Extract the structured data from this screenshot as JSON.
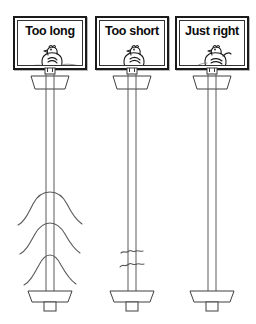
{
  "figure": {
    "title": "Too long / Too short / Just right comparison",
    "background_color": "#ffffff",
    "ink_color": "#1b1b1b",
    "line_color": "#555555"
  },
  "panels": [
    {
      "id": "too-long",
      "label": "Too long",
      "bird_icon": "chicken-icon",
      "bird_note": "chicken standing, tail feathers trailing long to both sides",
      "post_icon": "post-icon",
      "collar_icon": "collar-icon",
      "base_icon": "base-plate-icon",
      "excess_icon": "drooping-wire-icon",
      "excess_count": 3,
      "excess_note": "three long drooping arched wires hanging from the post"
    },
    {
      "id": "too-short",
      "label": "Too short",
      "bird_icon": "chicken-icon",
      "bird_note": "chicken standing with very short stubby tail",
      "post_icon": "post-icon",
      "collar_icon": "collar-icon",
      "base_icon": "base-plate-icon",
      "excess_icon": "crimped-wire-icon",
      "excess_count": 2,
      "excess_note": "two small crimped squiggle marks crossing the post"
    },
    {
      "id": "just-right",
      "label": "Just right",
      "bird_icon": "chicken-icon",
      "bird_note": "chicken standing with a single neat curled tail",
      "post_icon": "post-icon",
      "collar_icon": "collar-icon",
      "base_icon": "base-plate-icon",
      "excess_icon": "none",
      "excess_count": 0,
      "excess_note": "clean post with no excess wire"
    }
  ],
  "geometry": {
    "panel_lefts": [
      13,
      95,
      175
    ],
    "panel_width": 74,
    "panel_height": 54,
    "post_centers": [
      50,
      132,
      212
    ],
    "post_top": 70,
    "post_bottom": 311
  }
}
